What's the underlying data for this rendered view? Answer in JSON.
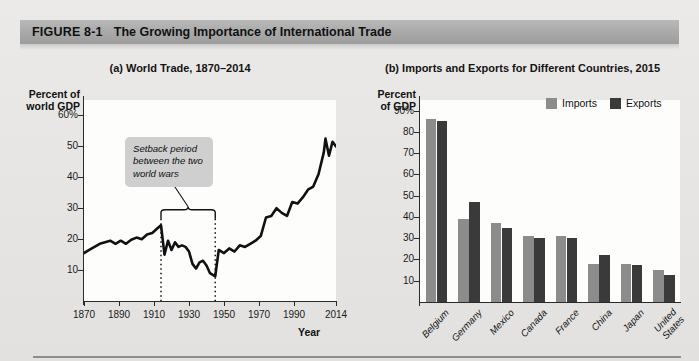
{
  "figure": {
    "number": "FIGURE  8-1",
    "title": "The Growing Importance of International Trade",
    "banner_color": "#ababab"
  },
  "panel_a": {
    "title": "(a) World Trade, 1870–2014",
    "y_axis_caption_line1": "Percent of",
    "y_axis_caption_line2": "world GDP",
    "x_axis_title": "Year",
    "annotation": "Setback period between the two world wars",
    "annotation_bg": "#cfcfcf",
    "line_color": "#111111"
  },
  "panel_b": {
    "title": "(b) Imports and Exports for Different Countries, 2015",
    "y_axis_caption_line1": "Percent",
    "y_axis_caption_line2": "of GDP",
    "legend": [
      {
        "label": "Imports",
        "color": "#8c8c8c"
      },
      {
        "label": "Exports",
        "color": "#3a3a3a"
      }
    ]
  },
  "chart_data": [
    {
      "type": "line",
      "id": "world-trade-share",
      "title": "(a) World Trade, 1870–2014",
      "xlabel": "Year",
      "ylabel": "Percent of world GDP",
      "xlim": [
        1870,
        2014
      ],
      "ylim": [
        0,
        65
      ],
      "yticks": [
        10,
        20,
        30,
        40,
        50,
        60
      ],
      "ytick_labels": [
        "10",
        "20",
        "30",
        "40",
        "50",
        "60%"
      ],
      "xticks": [
        1870,
        1890,
        1910,
        1930,
        1950,
        1970,
        1990,
        2014
      ],
      "xtick_labels": [
        "1870",
        "1890",
        "1910",
        "1930",
        "1950",
        "1970",
        "1990",
        "2014"
      ],
      "grid": false,
      "legend": "none",
      "annotations": [
        {
          "text": "Setback period between the two world wars",
          "span_start_year": 1914,
          "span_end_year": 1945,
          "style": "bracket-with-dotted-verticals"
        }
      ],
      "series": [
        {
          "name": "World trade as percent of world GDP",
          "x": [
            1870,
            1873,
            1876,
            1879,
            1882,
            1885,
            1888,
            1891,
            1894,
            1897,
            1900,
            1903,
            1906,
            1909,
            1912,
            1914,
            1916,
            1918,
            1920,
            1922,
            1924,
            1926,
            1928,
            1930,
            1932,
            1934,
            1936,
            1938,
            1940,
            1942,
            1945,
            1947,
            1950,
            1953,
            1956,
            1959,
            1962,
            1965,
            1968,
            1971,
            1974,
            1977,
            1980,
            1983,
            1986,
            1989,
            1992,
            1995,
            1998,
            2001,
            2004,
            2007,
            2008,
            2010,
            2012,
            2014
          ],
          "y": [
            15.5,
            16.5,
            17.5,
            18.5,
            19.0,
            19.5,
            18.5,
            19.5,
            18.5,
            19.8,
            20.5,
            20.0,
            21.5,
            22.0,
            23.5,
            24.5,
            15.0,
            19.5,
            16.5,
            19.0,
            17.5,
            18.0,
            17.5,
            16.0,
            12.0,
            10.5,
            12.5,
            13.0,
            11.5,
            9.0,
            8.0,
            16.5,
            15.5,
            17.0,
            16.0,
            18.0,
            17.5,
            18.5,
            19.5,
            21.0,
            27.0,
            27.5,
            30.0,
            28.5,
            27.5,
            32.0,
            31.5,
            33.5,
            36.0,
            37.0,
            41.0,
            48.0,
            52.5,
            47.0,
            51.5,
            50.0
          ]
        }
      ]
    },
    {
      "type": "bar",
      "id": "imports-exports-2015",
      "title": "(b) Imports and Exports for Different Countries, 2015",
      "xlabel": "",
      "ylabel": "Percent of GDP",
      "ylim": [
        0,
        95
      ],
      "yticks": [
        10,
        20,
        30,
        40,
        50,
        60,
        70,
        80,
        90
      ],
      "ytick_labels": [
        "10",
        "20",
        "30",
        "40",
        "50",
        "60",
        "70",
        "80",
        "90%"
      ],
      "grid": false,
      "legend_position": "top-right",
      "categories": [
        "Belgium",
        "Germany",
        "Mexico",
        "Canada",
        "France",
        "China",
        "Japan",
        "United States"
      ],
      "series": [
        {
          "name": "Imports",
          "color": "#8c8c8c",
          "values": [
            86,
            39,
            37,
            31,
            31,
            18,
            18,
            15
          ]
        },
        {
          "name": "Exports",
          "color": "#3a3a3a",
          "values": [
            85,
            47,
            35,
            30,
            30,
            22,
            17.5,
            12.5
          ]
        }
      ]
    }
  ]
}
